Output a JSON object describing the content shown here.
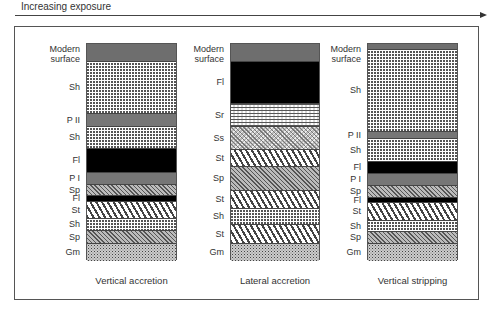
{
  "header": {
    "arrow_label": "Increasing exposure"
  },
  "legend_codes": {
    "Modern surface": "modern surface (grey)",
    "Fl": "black",
    "Sh": "fine dotted/dashed",
    "Sr": "ripple hatch",
    "Ss": "cross hatch",
    "St": "trough cross-bedding chevrons",
    "Sp": "planar diagonal hatch",
    "Gm": "gravel stipple",
    "P I": "paleosol (grey)",
    "P II": "paleosol (grey)"
  },
  "columns": [
    {
      "caption": "Vertical accretion",
      "x": 86,
      "width": 91,
      "layers": [
        {
          "label": "Modern surface",
          "pattern": "modern",
          "top": 43,
          "bottom": 61
        },
        {
          "label": "Sh",
          "pattern": "Sh",
          "top": 61,
          "bottom": 113
        },
        {
          "label": "P II",
          "pattern": "paleo",
          "top": 113,
          "bottom": 126
        },
        {
          "label": "Sh",
          "pattern": "Sh",
          "top": 126,
          "bottom": 148
        },
        {
          "label": "Fl",
          "pattern": "Fl",
          "top": 148,
          "bottom": 172
        },
        {
          "label": "P I",
          "pattern": "paleo",
          "top": 172,
          "bottom": 184
        },
        {
          "label": "Sp",
          "pattern": "Sp",
          "top": 184,
          "bottom": 195
        },
        {
          "label": "Fl",
          "pattern": "Fl",
          "top": 195,
          "bottom": 201
        },
        {
          "label": "St",
          "pattern": "St",
          "top": 201,
          "bottom": 218
        },
        {
          "label": "Sh",
          "pattern": "Sh",
          "top": 218,
          "bottom": 230
        },
        {
          "label": "Sp",
          "pattern": "Sp",
          "top": 230,
          "bottom": 243
        },
        {
          "label": "Gm",
          "pattern": "Gm",
          "top": 243,
          "bottom": 260
        }
      ]
    },
    {
      "caption": "Lateral accretion",
      "x": 230,
      "width": 90,
      "layers": [
        {
          "label": "Modern surface",
          "pattern": "modern",
          "top": 43,
          "bottom": 61
        },
        {
          "label": "Fl",
          "pattern": "Fl",
          "top": 61,
          "bottom": 103
        },
        {
          "label": "Sr",
          "pattern": "Sr",
          "top": 103,
          "bottom": 126
        },
        {
          "label": "Ss",
          "pattern": "Ss",
          "top": 126,
          "bottom": 149
        },
        {
          "label": "St",
          "pattern": "St",
          "top": 149,
          "bottom": 166
        },
        {
          "label": "Sp",
          "pattern": "Sp",
          "top": 166,
          "bottom": 190
        },
        {
          "label": "St",
          "pattern": "St",
          "top": 190,
          "bottom": 208
        },
        {
          "label": "Sh",
          "pattern": "Sh",
          "top": 208,
          "bottom": 224
        },
        {
          "label": "St",
          "pattern": "St",
          "top": 224,
          "bottom": 243
        },
        {
          "label": "Gm",
          "pattern": "Gm",
          "top": 243,
          "bottom": 260
        }
      ]
    },
    {
      "caption": "Vertical stripping",
      "x": 367,
      "width": 91,
      "layers": [
        {
          "label": "Modern surface",
          "pattern": "modern",
          "top": 43,
          "bottom": 49
        },
        {
          "label": "Sh",
          "pattern": "Sh",
          "top": 49,
          "bottom": 131
        },
        {
          "label": "P II",
          "pattern": "paleo",
          "top": 131,
          "bottom": 138
        },
        {
          "label": "Sh",
          "pattern": "Sh",
          "top": 138,
          "bottom": 161
        },
        {
          "label": "Fl",
          "pattern": "Fl",
          "top": 161,
          "bottom": 173
        },
        {
          "label": "P I",
          "pattern": "paleo",
          "top": 173,
          "bottom": 185
        },
        {
          "label": "Sp",
          "pattern": "Sp",
          "top": 185,
          "bottom": 197
        },
        {
          "label": "Fl",
          "pattern": "Fl",
          "top": 197,
          "bottom": 202
        },
        {
          "label": "St",
          "pattern": "St",
          "top": 202,
          "bottom": 220
        },
        {
          "label": "Sh",
          "pattern": "Sh",
          "top": 220,
          "bottom": 231
        },
        {
          "label": "Sp",
          "pattern": "Sp",
          "top": 231,
          "bottom": 243
        },
        {
          "label": "Gm",
          "pattern": "Gm",
          "top": 243,
          "bottom": 260
        }
      ]
    }
  ]
}
